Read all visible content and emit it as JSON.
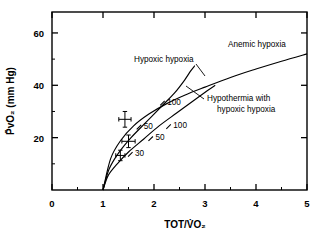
{
  "chart_data": {
    "type": "line",
    "title": "",
    "xlabel": "TOT/V̇O₂",
    "ylabel": "P̄vO₂ (mm Hg)",
    "xlim": [
      0,
      5
    ],
    "ylim": [
      0,
      68
    ],
    "grid": false,
    "legend_position": "inline-labels",
    "xticks": [
      0,
      1,
      2,
      3,
      4,
      5
    ],
    "xtick_labels": [
      "0",
      "1",
      "2",
      "3",
      "4",
      "5"
    ],
    "yticks": [
      20,
      40,
      60
    ],
    "ytick_labels": [
      "20",
      "40",
      "60"
    ],
    "x_minor_ticks": [
      0.5,
      1.5,
      2.5,
      3.5,
      4.5
    ],
    "y_minor_ticks": [
      10,
      30,
      50
    ],
    "series": [
      {
        "name": "Anemic hypoxia",
        "label": "Anemic hypoxia",
        "x": [
          1.0,
          1.15,
          1.35,
          1.6,
          1.9,
          2.25,
          2.6,
          3.0,
          3.5,
          4.0,
          4.5,
          5.0
        ],
        "y": [
          0.0,
          12.0,
          19.0,
          24.5,
          29.0,
          33.0,
          36.2,
          39.3,
          43.0,
          46.2,
          49.2,
          52.0
        ]
      },
      {
        "name": "Hypoxic hypoxia",
        "label": "Hypoxic hypoxia",
        "x": [
          1.0,
          1.12,
          1.3,
          1.55,
          1.85,
          2.15,
          2.4,
          2.6,
          2.72,
          2.8
        ],
        "y": [
          0.0,
          8.0,
          14.0,
          20.0,
          26.0,
          32.0,
          37.0,
          42.0,
          45.5,
          47.5
        ]
      },
      {
        "name": "Hypothermia with hypoxic hypoxia",
        "label": "Hypothermia with hypoxic hypoxia",
        "x": [
          1.0,
          1.1,
          1.28,
          1.5,
          1.8,
          2.1,
          2.45,
          2.8,
          3.05,
          3.2
        ],
        "y": [
          0.0,
          5.5,
          10.0,
          14.5,
          19.5,
          24.5,
          29.5,
          34.5,
          38.0,
          40.0
        ]
      }
    ],
    "curve_markers": [
      {
        "label": "100",
        "x": 2.18,
        "y": 33.2,
        "series": "Hypoxic hypoxia"
      },
      {
        "label": "50",
        "x": 1.72,
        "y": 24.0,
        "series": "Hypoxic hypoxia"
      },
      {
        "label": "100",
        "x": 2.3,
        "y": 24.2,
        "series": "Hypothermia with hypoxic hypoxia"
      },
      {
        "label": "50",
        "x": 1.95,
        "y": 19.6,
        "series": "Hypothermia with hypoxic hypoxia"
      },
      {
        "label": "30",
        "x": 1.55,
        "y": 13.6,
        "series": "Hypothermia with hypoxic hypoxia"
      }
    ],
    "error_points": [
      {
        "x": 1.43,
        "y": 27.0,
        "xerr": 0.12,
        "yerr": 3.0
      },
      {
        "x": 1.5,
        "y": 18.6,
        "xerr": 0.13,
        "yerr": 2.4
      },
      {
        "x": 1.34,
        "y": 13.2,
        "xerr": 0.09,
        "yerr": 2.0
      }
    ]
  }
}
